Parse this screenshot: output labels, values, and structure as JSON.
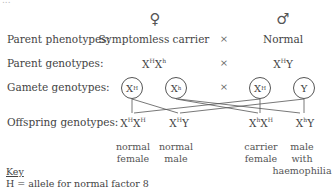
{
  "top_cut_text": "...",
  "parents": {
    "female_symbol": "♀",
    "male_symbol": "♂",
    "phenotype_label": "Parent phenotypes:",
    "female_phenotype": "Symptomless carrier",
    "male_phenotype": "Normal",
    "genotype_label": "Parent genotypes:",
    "female_genotype": {
      "a": "X",
      "a_sup": "H",
      "b": "X",
      "b_sup": "h"
    },
    "male_genotype": {
      "a": "X",
      "a_sup": "H",
      "b": "Y"
    },
    "cross": "×"
  },
  "gametes": {
    "label": "Gamete genotypes:",
    "items": [
      {
        "base": "X",
        "sup": "H"
      },
      {
        "base": "X",
        "sup": "h"
      },
      {
        "base": "X",
        "sup": "H"
      },
      {
        "base": "Y",
        "sup": ""
      }
    ],
    "cross": "×"
  },
  "offspring": {
    "label": "Offspring genotypes:",
    "items": [
      {
        "a": "X",
        "a_sup": "H",
        "b": "X",
        "b_sup": "H",
        "phenotype_line1": "normal",
        "phenotype_line2": "female",
        "phenotype_line3": ""
      },
      {
        "a": "X",
        "a_sup": "H",
        "b": "Y",
        "b_sup": "",
        "phenotype_line1": "normal",
        "phenotype_line2": "male",
        "phenotype_line3": ""
      },
      {
        "a": "X",
        "a_sup": "h",
        "b": "X",
        "b_sup": "H",
        "phenotype_line1": "carrier",
        "phenotype_line2": "female",
        "phenotype_line3": ""
      },
      {
        "a": "X",
        "a_sup": "h",
        "b": "Y",
        "b_sup": "",
        "phenotype_line1": "male",
        "phenotype_line2": "with",
        "phenotype_line3": "haemophilia"
      }
    ]
  },
  "key": {
    "title": "Key",
    "line1": "H = allele for normal factor 8"
  },
  "colors": {
    "text": "#444444",
    "lines": "#555555",
    "background": "#ffffff"
  }
}
